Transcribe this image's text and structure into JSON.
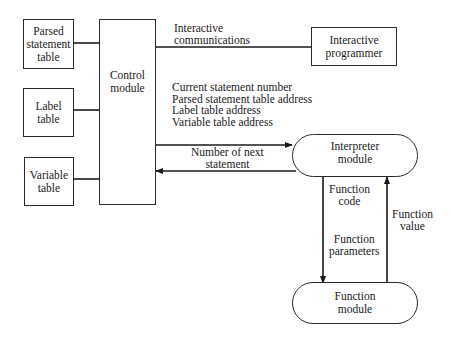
{
  "diagram": {
    "nodes": {
      "parsed_statement_table": "Parsed\nstatement\ntable",
      "label_table": "Label\ntable",
      "variable_table": "Variable\ntable",
      "control_module": "Control\nmodule",
      "interactive_programmer": "Interactive\nprogrammer",
      "interpreter_module": "Interpreter\nmodule",
      "function_module": "Function\nmodule"
    },
    "edge_labels": {
      "interactive_communications": "Interactive\ncommunications",
      "control_to_interpreter": "Current statement number\nParsed statement table address\nLabel table address\nVariable table address",
      "interpreter_to_control": "Number of next\nstatement",
      "function_code": "Function\ncode",
      "function_parameters": "Function\nparameters",
      "function_value": "Function\nvalue"
    },
    "edges": [
      {
        "from": "parsed_statement_table",
        "to": "control_module",
        "type": "line"
      },
      {
        "from": "label_table",
        "to": "control_module",
        "type": "line"
      },
      {
        "from": "variable_table",
        "to": "control_module",
        "type": "line"
      },
      {
        "from": "control_module",
        "to": "interactive_programmer",
        "type": "line",
        "label": "interactive_communications"
      },
      {
        "from": "control_module",
        "to": "interpreter_module",
        "type": "arrow",
        "label": "control_to_interpreter"
      },
      {
        "from": "interpreter_module",
        "to": "control_module",
        "type": "arrow",
        "label": "interpreter_to_control"
      },
      {
        "from": "interpreter_module",
        "to": "function_module",
        "type": "arrow",
        "label": "function_code / function_parameters"
      },
      {
        "from": "function_module",
        "to": "interpreter_module",
        "type": "arrow",
        "label": "function_value"
      }
    ],
    "colors": {
      "line": "#1a1a1a",
      "background": "#ffffff"
    }
  }
}
